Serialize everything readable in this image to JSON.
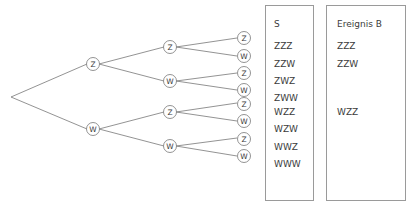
{
  "diagram": {
    "type": "probability-tree",
    "root": {
      "name": "root-node",
      "label": ""
    },
    "level_labels": [
      "Z",
      "W"
    ],
    "nodes": {
      "level1": [
        {
          "id": "n-z",
          "label": "Z"
        },
        {
          "id": "n-w",
          "label": "W"
        }
      ],
      "level2": [
        {
          "id": "n-zz",
          "label": "Z"
        },
        {
          "id": "n-zw",
          "label": "W"
        },
        {
          "id": "n-wz",
          "label": "Z"
        },
        {
          "id": "n-ww",
          "label": "W"
        }
      ],
      "level3": [
        {
          "id": "n-zzz",
          "label": "Z"
        },
        {
          "id": "n-zzw",
          "label": "W"
        },
        {
          "id": "n-zwz",
          "label": "Z"
        },
        {
          "id": "n-zww",
          "label": "W"
        },
        {
          "id": "n-wzz",
          "label": "Z"
        },
        {
          "id": "n-wzw",
          "label": "W"
        },
        {
          "id": "n-wwz",
          "label": "Z"
        },
        {
          "id": "n-www",
          "label": "W"
        }
      ]
    }
  },
  "panel_s": {
    "title": "S",
    "rows": [
      "ZZZ",
      "ZZW",
      "ZWZ",
      "ZWW",
      "WZZ",
      "WZW",
      "WWZ",
      "WWW"
    ]
  },
  "panel_b": {
    "title": "Ereignis B",
    "rows": [
      "ZZZ",
      "ZZW",
      "",
      "",
      "WZZ",
      "",
      "",
      ""
    ]
  },
  "colors": {
    "stroke": "#777777",
    "text": "#3b3b3b",
    "panel_border": "#9a9a9a",
    "background": "#ffffff"
  }
}
